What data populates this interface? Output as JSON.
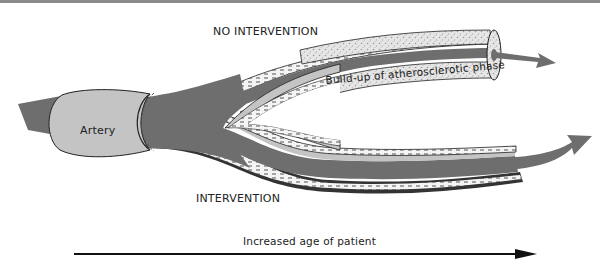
{
  "diagram": {
    "labels": {
      "no_intervention": "NO INTERVENTION",
      "intervention": "INTERVENTION",
      "artery": "Artery",
      "buildup": "Build-up of atherosclerotic phase",
      "age_axis": "Increased age of patient"
    },
    "colors": {
      "blood_flow": "#6e6e6e",
      "artery_wall": "#c4c4c4",
      "plaque": "#d8d8d8",
      "outline": "#222222",
      "top_rule": "#8a8a8a"
    },
    "branches": [
      {
        "name": "no-intervention",
        "state": "narrowed lumen with thick plaque build-up"
      },
      {
        "name": "intervention",
        "state": "open lumen with thin wall"
      }
    ]
  }
}
